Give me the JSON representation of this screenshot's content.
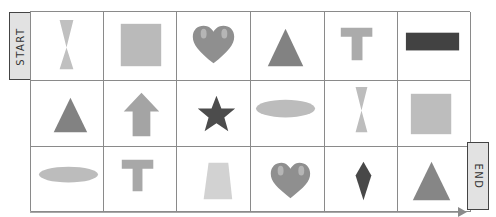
{
  "labels": {
    "start": "START",
    "end": "END"
  },
  "colors": {
    "grid_line": "#8a8a8a",
    "label_bg": "#e2e2e2",
    "light_gray": "#b8b8b8",
    "mid_gray": "#8e8e8e",
    "dark_gray": "#4a4a4a",
    "heart": "#8f8f8f"
  },
  "grid": {
    "rows": 3,
    "cols": 6,
    "cells": [
      [
        {
          "shape": "hourglass",
          "color": "light"
        },
        {
          "shape": "square",
          "color": "light"
        },
        {
          "shape": "heart",
          "color": "mid"
        },
        {
          "shape": "triangle",
          "color": "mid"
        },
        {
          "shape": "t-shape",
          "color": "light"
        },
        {
          "shape": "bar",
          "color": "dark"
        }
      ],
      [
        {
          "shape": "triangle",
          "color": "mid"
        },
        {
          "shape": "up-arrow",
          "color": "light"
        },
        {
          "shape": "star",
          "color": "dark"
        },
        {
          "shape": "ellipse",
          "color": "light"
        },
        {
          "shape": "hourglass",
          "color": "light"
        },
        {
          "shape": "square",
          "color": "light"
        }
      ],
      [
        {
          "shape": "ellipse",
          "color": "light"
        },
        {
          "shape": "t-shape",
          "color": "light"
        },
        {
          "shape": "trapezoid",
          "color": "light"
        },
        {
          "shape": "heart",
          "color": "mid"
        },
        {
          "shape": "diamond",
          "color": "dark"
        },
        {
          "shape": "triangle",
          "color": "mid"
        }
      ]
    ]
  }
}
